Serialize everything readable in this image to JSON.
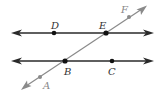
{
  "diagram": {
    "type": "parallel-lines-with-transversal",
    "colors": {
      "parallel_line": "#2a2a2a",
      "transversal": "#8a8a8a",
      "point_dark": "#111111",
      "point_gray": "#8a8a8a",
      "label": "#333333"
    },
    "lines": [
      {
        "id": "line-DE",
        "x1": 12,
        "y1": 33,
        "x2": 153,
        "y2": 33
      },
      {
        "id": "line-BC",
        "x1": 12,
        "y1": 61,
        "x2": 153,
        "y2": 61
      },
      {
        "id": "transversal-AF",
        "x1": 22,
        "y1": 89,
        "x2": 146,
        "y2": 6
      }
    ],
    "points": [
      {
        "label": "D",
        "x": 54,
        "y": 33,
        "lx": 51,
        "ly": 27
      },
      {
        "label": "E",
        "x": 106,
        "y": 33,
        "lx": 99,
        "ly": 27
      },
      {
        "label": "F",
        "x": 129,
        "y": 17,
        "lx": 121,
        "ly": 12
      },
      {
        "label": "B",
        "x": 65,
        "y": 61,
        "lx": 64,
        "ly": 74
      },
      {
        "label": "C",
        "x": 112,
        "y": 61,
        "lx": 108,
        "ly": 74
      },
      {
        "label": "A",
        "x": 40,
        "y": 77,
        "lx": 43,
        "ly": 88
      }
    ]
  }
}
